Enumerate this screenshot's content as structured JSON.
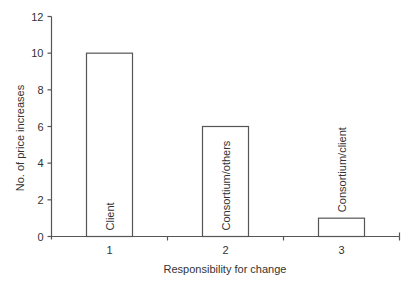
{
  "chart_data": {
    "type": "bar",
    "title": "",
    "xlabel": "Responsibility for change",
    "ylabel": "No. of price increases",
    "categories": [
      "1",
      "2",
      "3"
    ],
    "values": [
      10,
      6,
      1
    ],
    "bar_labels": [
      "Client",
      "Consortium/others",
      "Consortium/client"
    ],
    "ylim": [
      0,
      12
    ],
    "yticks": [
      0,
      2,
      4,
      6,
      8,
      10,
      12
    ],
    "grid": false,
    "legend": null,
    "colors": {
      "bar_fill": "#ffffff",
      "bar_stroke": "#555555",
      "axis": "#555555"
    }
  }
}
